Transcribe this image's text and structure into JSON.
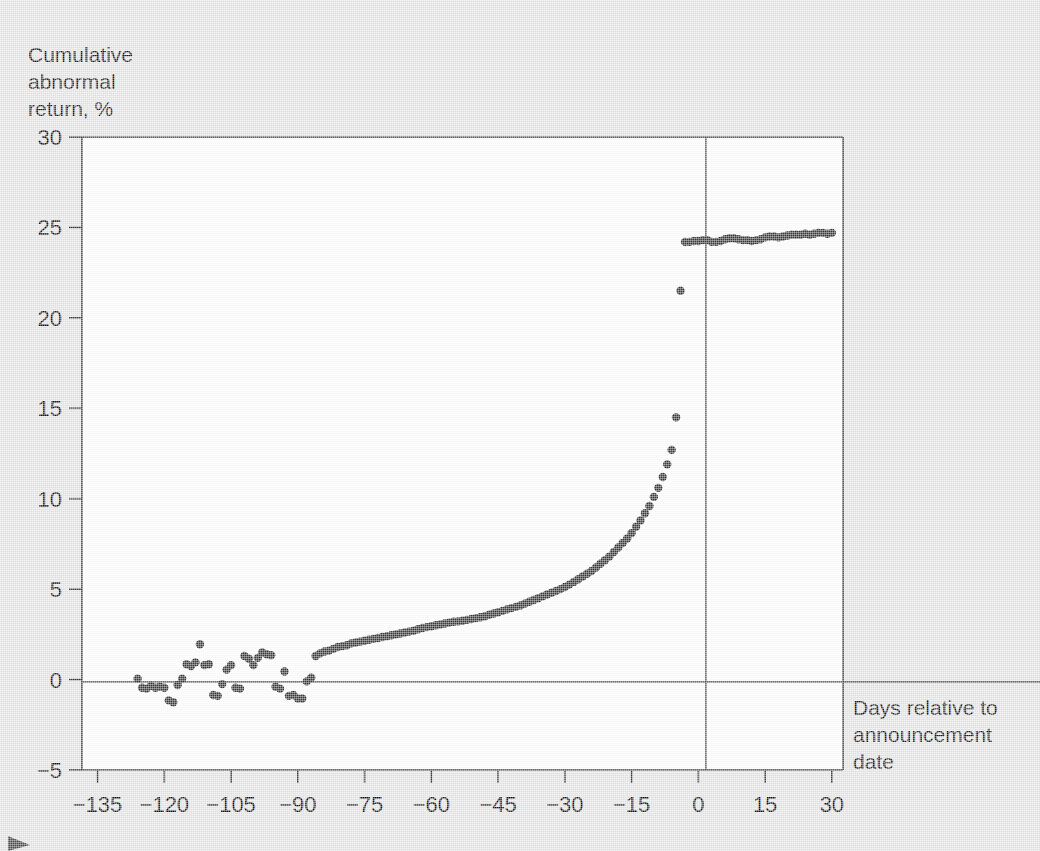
{
  "figure": {
    "background_color": "#e4e4e4",
    "plot_background_color": "#fdfdfd",
    "point_color": "#3a3a3a",
    "axis_color": "#3b3b3b",
    "y_axis_label_line1": "Cumulative",
    "y_axis_label_line2": "abnormal",
    "y_axis_label_line3": "return, %",
    "x_axis_label_line1": "Days relative to",
    "x_axis_label_line2": "announcement",
    "x_axis_label_line3": "date"
  },
  "chart_data": {
    "type": "scatter",
    "title": "",
    "xlabel": "Days relative to announcement date",
    "ylabel": "Cumulative abnormal return, %",
    "xlim": [
      -138.5,
      32.5
    ],
    "ylim": [
      -5,
      30
    ],
    "xticks": [
      -135,
      -120,
      -105,
      -90,
      -75,
      -60,
      -45,
      -30,
      -15,
      0,
      15,
      30
    ],
    "yticks": [
      -5,
      0,
      5,
      10,
      15,
      20,
      25,
      30
    ],
    "xtick_labels": [
      "−135",
      "−120",
      "−105",
      "−90",
      "−75",
      "−60",
      "−45",
      "−30",
      "−15",
      "0",
      "15",
      "30"
    ],
    "ytick_labels": [
      "−5",
      "0",
      "5",
      "10",
      "15",
      "20",
      "25",
      "30"
    ],
    "grid": false,
    "legend": null,
    "annotations": [
      {
        "type": "horizontal-reference-line",
        "y": 0
      },
      {
        "type": "vertical-reference-line",
        "x": 0,
        "note": "announcement date"
      }
    ],
    "series": [
      {
        "name": "Cumulative abnormal return",
        "marker": "circle",
        "x": [
          -126,
          -125,
          -124,
          -123,
          -122,
          -121,
          -120,
          -119,
          -118,
          -117,
          -116,
          -115,
          -114,
          -113,
          -112,
          -111,
          -110,
          -109,
          -108,
          -107,
          -106,
          -105,
          -104,
          -103,
          -102,
          -101,
          -100,
          -99,
          -98,
          -97,
          -96,
          -95,
          -94,
          -93,
          -92,
          -91,
          -90,
          -89,
          -88,
          -87,
          -86,
          -85,
          -84,
          -83,
          -82,
          -81,
          -80,
          -79,
          -78,
          -77,
          -76,
          -75,
          -74,
          -73,
          -72,
          -71,
          -70,
          -69,
          -68,
          -67,
          -66,
          -65,
          -64,
          -63,
          -62,
          -61,
          -60,
          -59,
          -58,
          -57,
          -56,
          -55,
          -54,
          -53,
          -52,
          -51,
          -50,
          -49,
          -48,
          -47,
          -46,
          -45,
          -44,
          -43,
          -42,
          -41,
          -40,
          -39,
          -38,
          -37,
          -36,
          -35,
          -34,
          -33,
          -32,
          -31,
          -30,
          -29,
          -28,
          -27,
          -26,
          -25,
          -24,
          -23,
          -22,
          -21,
          -20,
          -19,
          -18,
          -17,
          -16,
          -15,
          -14,
          -13,
          -12,
          -11,
          -10,
          -9,
          -8,
          -7,
          -6,
          -5,
          -4,
          -3,
          -2,
          -1,
          0,
          1,
          2,
          3,
          4,
          5,
          6,
          7,
          8,
          9,
          10,
          11,
          12,
          13,
          14,
          15,
          16,
          17,
          18,
          19,
          20,
          21,
          22,
          23,
          24,
          25,
          26,
          27,
          28,
          29,
          30
        ],
        "y": [
          0.05,
          -0.45,
          -0.5,
          -0.35,
          -0.45,
          -0.4,
          -0.45,
          -1.15,
          -1.25,
          -0.3,
          0.05,
          0.85,
          0.75,
          0.95,
          1.95,
          0.8,
          0.85,
          -0.85,
          -0.9,
          -0.25,
          0.55,
          0.8,
          -0.45,
          -0.5,
          1.3,
          1.15,
          0.8,
          1.2,
          1.5,
          1.4,
          1.35,
          -0.4,
          -0.5,
          0.45,
          -0.9,
          -0.85,
          -1.05,
          -1.05,
          -0.1,
          0.1,
          1.3,
          1.45,
          1.55,
          1.6,
          1.7,
          1.8,
          1.85,
          1.9,
          2.0,
          2.05,
          2.1,
          2.15,
          2.2,
          2.25,
          2.3,
          2.35,
          2.4,
          2.45,
          2.5,
          2.55,
          2.6,
          2.65,
          2.7,
          2.78,
          2.85,
          2.9,
          2.95,
          3.0,
          3.05,
          3.1,
          3.15,
          3.2,
          3.22,
          3.25,
          3.3,
          3.35,
          3.4,
          3.45,
          3.5,
          3.58,
          3.65,
          3.72,
          3.8,
          3.88,
          3.95,
          4.02,
          4.1,
          4.2,
          4.3,
          4.4,
          4.5,
          4.6,
          4.7,
          4.8,
          4.9,
          5.0,
          5.12,
          5.25,
          5.4,
          5.55,
          5.7,
          5.85,
          6.0,
          6.2,
          6.4,
          6.6,
          6.8,
          7.05,
          7.3,
          7.55,
          7.8,
          8.1,
          8.45,
          8.8,
          9.2,
          9.6,
          10.1,
          10.6,
          11.2,
          11.9,
          12.7,
          14.5,
          21.5,
          24.2,
          24.2,
          24.25,
          24.25,
          24.3,
          24.3,
          24.2,
          24.2,
          24.25,
          24.35,
          24.4,
          24.4,
          24.35,
          24.3,
          24.3,
          24.25,
          24.3,
          24.35,
          24.45,
          24.5,
          24.5,
          24.45,
          24.5,
          24.55,
          24.6,
          24.6,
          24.6,
          24.65,
          24.6,
          24.65,
          24.7,
          24.7,
          24.65,
          24.7
        ]
      }
    ]
  }
}
